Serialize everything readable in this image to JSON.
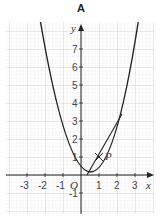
{
  "title": "A",
  "axes": {
    "x_label": "x",
    "y_label": "y",
    "origin_label": "O",
    "x_ticks": [
      "-3",
      "-2",
      "-1",
      "1",
      "2",
      "3"
    ],
    "y_ticks": [
      "-1",
      "1",
      "2",
      "3",
      "4",
      "5",
      "6",
      "7"
    ]
  },
  "point": {
    "label": "P",
    "x": 1,
    "y": 1
  },
  "curve": "parabola through P with minimum near (0.6, 0.8)",
  "tangent": "straight line touching curve at P",
  "colors": {
    "grid": "#d8d8d8",
    "grid_major": "#bdbdbd",
    "curve": "#222222",
    "axis": "#222222"
  }
}
